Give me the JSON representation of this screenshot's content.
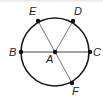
{
  "diagram": {
    "type": "circle-geometry",
    "center": {
      "label": "A",
      "x": 55,
      "y": 52
    },
    "radius": 34,
    "points": [
      {
        "label": "B",
        "x": 21,
        "y": 52,
        "label_x": 9,
        "label_y": 56
      },
      {
        "label": "C",
        "x": 90,
        "y": 52,
        "label_x": 93,
        "label_y": 56
      },
      {
        "label": "D",
        "x": 73,
        "y": 21,
        "label_x": 74,
        "label_y": 15
      },
      {
        "label": "E",
        "x": 38,
        "y": 21,
        "label_x": 29,
        "label_y": 15
      },
      {
        "label": "F",
        "x": 72,
        "y": 83,
        "label_x": 72,
        "label_y": 95
      }
    ],
    "center_label_pos": {
      "x": 46,
      "y": 63
    },
    "segments": [
      "BC",
      "AD",
      "AE",
      "AF"
    ],
    "colors": {
      "circle": "#1a1a1a",
      "segments": "#555555",
      "points": "#111111"
    }
  }
}
